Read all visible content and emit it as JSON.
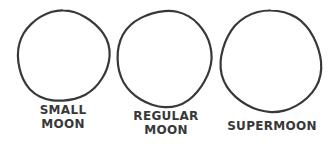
{
  "comic": {
    "ink_color": "#383838",
    "background_color": "#ffffff",
    "moons": [
      {
        "id": "small-moon",
        "label_lines": [
          "SMALL",
          "MOON"
        ],
        "cx": 63,
        "cy": 56,
        "r": 45.5,
        "label_x": 63,
        "label_y": 103
      },
      {
        "id": "regular-moon",
        "label_lines": [
          "REGULAR",
          "MOON"
        ],
        "cx": 164.5,
        "cy": 58.5,
        "r": 47.5,
        "label_x": 166,
        "label_y": 109
      },
      {
        "id": "supermoon",
        "label_lines": [
          "SUPERMOON"
        ],
        "cx": 271,
        "cy": 61.5,
        "r": 50.5,
        "label_x": 272,
        "label_y": 119
      }
    ]
  }
}
